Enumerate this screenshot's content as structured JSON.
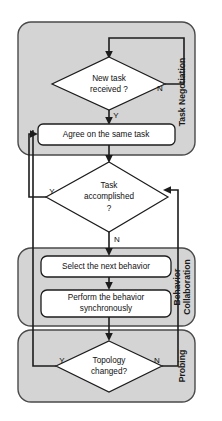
{
  "diagram": {
    "type": "flowchart",
    "background_color": "#ffffff",
    "group_fill_color": "#d4d4d4",
    "group_border_color": "#4a4a4a",
    "node_fill_color": "#ffffff",
    "line_color": "#1c1c1c"
  },
  "groups": [
    {
      "id": "task-negotiation",
      "label": "Task Negotiation"
    },
    {
      "id": "behavior-collaboration",
      "label": "Behavior Collaboration",
      "label_line1": "Behavior",
      "label_line2": "Collaboration"
    },
    {
      "id": "probing",
      "label": "Probing"
    }
  ],
  "nodes": {
    "new_task": {
      "shape": "decision",
      "label": "New task received ?",
      "line1": "New task",
      "line2": "received ?"
    },
    "agree_task": {
      "shape": "process",
      "label": "Agree on the same task"
    },
    "task_accomplished": {
      "shape": "decision",
      "label": "Task accomplished ?",
      "line1": "Task",
      "line2": "accomplished",
      "line3": "?"
    },
    "select_behavior": {
      "shape": "process",
      "label": "Select the next behavior"
    },
    "perform_behavior": {
      "shape": "process",
      "label": "Perform the behavior synchronously",
      "line1": "Perform the behavior",
      "line2": "synchronously"
    },
    "topology_changed": {
      "shape": "decision",
      "label": "Topology changed?",
      "line1": "Topology",
      "line2": "changed?"
    }
  },
  "edge_labels": {
    "new_task_no": "N",
    "new_task_yes": "Y",
    "task_accomplished_yes": "Y",
    "task_accomplished_no": "N",
    "topology_yes": "Y",
    "topology_no": "N"
  }
}
